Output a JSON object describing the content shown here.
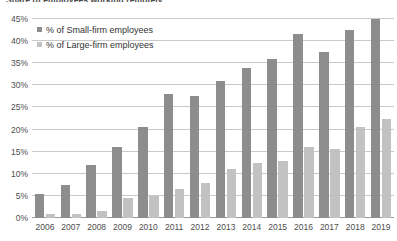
{
  "chart_data": {
    "type": "bar",
    "title": "Share of employees working remotely",
    "xlabel": "",
    "ylabel": "",
    "ylim": [
      0,
      45
    ],
    "ytick_step": 5,
    "ytick_labels": [
      "0%",
      "5%",
      "10%",
      "15%",
      "20%",
      "25%",
      "30%",
      "35%",
      "40%",
      "45%"
    ],
    "ytick_values": [
      0,
      5,
      10,
      15,
      20,
      25,
      30,
      35,
      40,
      45
    ],
    "grid": true,
    "legend_position": "top-left",
    "categories": [
      "2006",
      "2007",
      "2008",
      "2009",
      "2010",
      "2011",
      "2012",
      "2013",
      "2014",
      "2015",
      "2016",
      "2017",
      "2018",
      "2019"
    ],
    "series": [
      {
        "name": "% of Small-firm employees",
        "color": "#8d8d8d",
        "values": [
          5.5,
          7.5,
          12.0,
          16.0,
          20.5,
          28.0,
          27.5,
          31.0,
          34.0,
          36.0,
          41.5,
          37.5,
          42.5,
          45.0
        ]
      },
      {
        "name": "% of Large-firm employees",
        "color": "#c2c2c2",
        "values": [
          1.0,
          1.0,
          1.5,
          4.5,
          5.0,
          6.5,
          8.0,
          11.0,
          12.5,
          13.0,
          16.0,
          15.5,
          20.5,
          22.5
        ]
      }
    ]
  },
  "legend": {
    "items": [
      {
        "label": "% of Small-firm employees",
        "color": "#8d8d8d"
      },
      {
        "label": "% of Large-firm employees",
        "color": "#c2c2c2"
      }
    ]
  },
  "colors": {
    "small_firm": "#8d8d8d",
    "large_firm": "#c2c2c2",
    "gridline": "#c9c9c9",
    "axis": "#9a9a9a",
    "text": "#4d4d4d",
    "background": "#ffffff"
  }
}
